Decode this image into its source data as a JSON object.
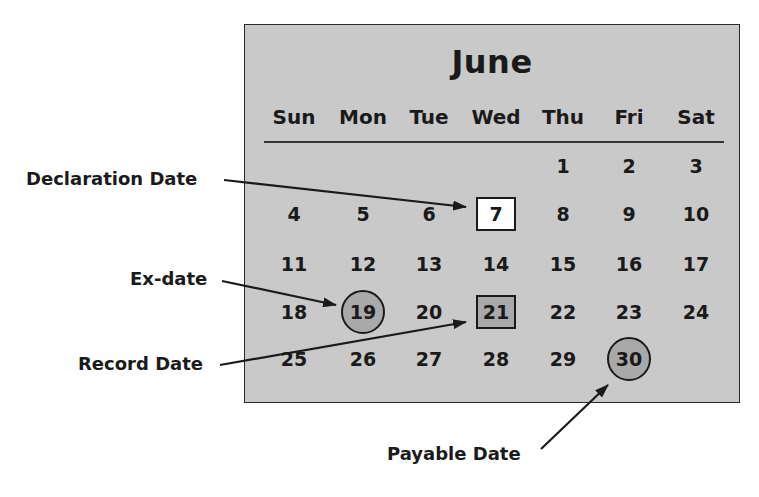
{
  "calendar": {
    "month": "June",
    "weekdays": [
      "Sun",
      "Mon",
      "Tue",
      "Wed",
      "Thu",
      "Fri",
      "Sat"
    ],
    "weeks": [
      [
        "",
        "",
        "",
        "",
        "1",
        "2",
        "3"
      ],
      [
        "4",
        "5",
        "6",
        "7",
        "8",
        "9",
        "10"
      ],
      [
        "11",
        "12",
        "13",
        "14",
        "15",
        "16",
        "17"
      ],
      [
        "18",
        "19",
        "20",
        "21",
        "22",
        "23",
        "24"
      ],
      [
        "25",
        "26",
        "27",
        "28",
        "29",
        "30",
        ""
      ]
    ]
  },
  "callouts": {
    "declaration": {
      "label": "Declaration Date",
      "day": "7",
      "marker": "white-square"
    },
    "ex_date": {
      "label": "Ex-date",
      "day": "19",
      "marker": "gray-circle"
    },
    "record": {
      "label": "Record Date",
      "day": "21",
      "marker": "gray-square"
    },
    "payable": {
      "label": "Payable Date",
      "day": "30",
      "marker": "gray-circle"
    }
  },
  "colors": {
    "calendar_background": "#c9c9c9",
    "marker_fill": "#a9a9a9",
    "ink": "#1a1a1a",
    "page_background": "#ffffff"
  }
}
